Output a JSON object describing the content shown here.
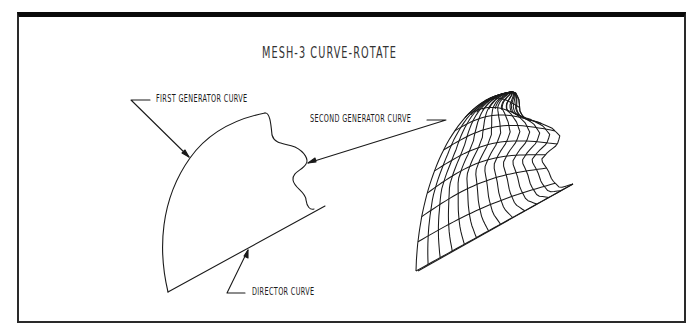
{
  "title": "MESH-3 CURVE-ROTATE",
  "labels": {
    "first_generator": "FIRST GENERATOR CURVE",
    "second_generator": "SECOND GENERATOR CURVE",
    "director": "DIRECTOR CURVE"
  },
  "figures": {
    "left": "curve construction: first generator curve, second generator curve, director curve",
    "right": "resulting rotated mesh surface"
  },
  "mesh": {
    "meridians": 13,
    "parallels": 9
  },
  "colors": {
    "ink": "#1a1a1a",
    "frame": "#0a0a0a",
    "background": "#ffffff"
  }
}
